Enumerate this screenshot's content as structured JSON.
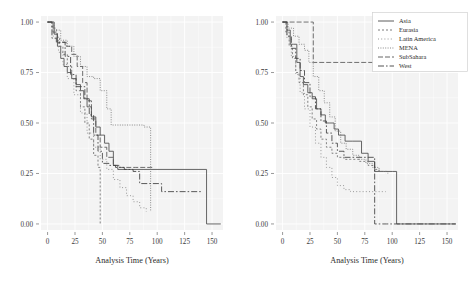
{
  "figure": {
    "panels": [
      {
        "id": "left",
        "xlabel": "Analysis Time (Years)",
        "ylabel": "",
        "xticks": [
          0,
          25,
          50,
          75,
          100,
          125,
          150
        ],
        "xticklabels": [
          "0",
          "25",
          "50",
          "75",
          "100",
          "125",
          "150"
        ],
        "yticks": [
          0.0,
          0.25,
          0.5,
          0.75,
          1.0
        ],
        "yticklabels": [
          "0.00",
          "0.25",
          "0.50",
          "0.75",
          "1.00"
        ],
        "xlim": [
          -6,
          160
        ],
        "ylim": [
          -0.03,
          1.03
        ]
      },
      {
        "id": "right",
        "xlabel": "Analysis Time (Years)",
        "ylabel": "",
        "xticks": [
          0,
          25,
          50,
          75,
          100,
          125,
          150
        ],
        "xticklabels": [
          "0",
          "25",
          "50",
          "75",
          "100",
          "125",
          "150"
        ],
        "yticks": [
          0.0,
          0.25,
          0.5,
          0.75,
          1.0
        ],
        "yticklabels": [
          "0.00",
          "0.25",
          "0.50",
          "0.75",
          "1.00"
        ],
        "xlim": [
          -6,
          160
        ],
        "ylim": [
          -0.03,
          1.03
        ]
      }
    ]
  },
  "legend": {
    "position": "top-right",
    "items": [
      {
        "label": "Asia",
        "dash": "none",
        "color": "#4a4a4a"
      },
      {
        "label": "Eurasia",
        "dash": "2,2",
        "color": "#6e6e6e"
      },
      {
        "label": "Latin America",
        "dash": "1,2.2",
        "color": "#8a8a8a"
      },
      {
        "label": "MENA",
        "dash": "1,1.4",
        "color": "#7a7a7a"
      },
      {
        "label": "SubSahara",
        "dash": "5,2",
        "color": "#555555"
      },
      {
        "label": "West",
        "dash": "6,2,1.6,2",
        "color": "#3f3f3f"
      }
    ]
  },
  "chart_data": {
    "type": "line",
    "title": "",
    "xlabel": "Analysis Time (Years)",
    "ylabel": "",
    "xlim": [
      -6,
      160
    ],
    "ylim": [
      -0.03,
      1.03
    ],
    "grid": true,
    "panels": [
      {
        "name": "left",
        "series": [
          {
            "name": "Asia",
            "style": "solid",
            "x": [
              0,
              3,
              6,
              9,
              12,
              15,
              18,
              22,
              26,
              30,
              33,
              36,
              40,
              44,
              48,
              52,
              56,
              60,
              64,
              145,
              145,
              158
            ],
            "y": [
              1.0,
              1.0,
              0.94,
              0.88,
              0.82,
              0.78,
              0.75,
              0.72,
              0.69,
              0.66,
              0.62,
              0.58,
              0.53,
              0.48,
              0.44,
              0.4,
              0.36,
              0.29,
              0.27,
              0.27,
              0.0,
              0.0
            ]
          },
          {
            "name": "Eurasia",
            "style": "dashed",
            "x": [
              0,
              4,
              8,
              11,
              14,
              18,
              22,
              26,
              30,
              34,
              38,
              42,
              46,
              48,
              48
            ],
            "y": [
              1.0,
              0.97,
              0.92,
              0.88,
              0.84,
              0.78,
              0.72,
              0.66,
              0.58,
              0.5,
              0.42,
              0.34,
              0.28,
              0.12,
              0.0
            ]
          },
          {
            "name": "Latin America",
            "style": "dotted",
            "x": [
              0,
              5,
              10,
              14,
              18,
              24,
              30,
              36,
              42,
              48,
              54,
              60,
              66,
              72,
              78,
              84,
              90
            ],
            "y": [
              1.0,
              0.93,
              0.85,
              0.79,
              0.72,
              0.64,
              0.55,
              0.45,
              0.38,
              0.32,
              0.27,
              0.22,
              0.18,
              0.14,
              0.11,
              0.08,
              0.06
            ]
          },
          {
            "name": "MENA",
            "style": "dotted-fine",
            "x": [
              0,
              6,
              12,
              18,
              24,
              30,
              36,
              42,
              48,
              54,
              58,
              62,
              68,
              80,
              88,
              94,
              94
            ],
            "y": [
              1.0,
              0.96,
              0.91,
              0.88,
              0.83,
              0.78,
              0.73,
              0.72,
              0.66,
              0.57,
              0.49,
              0.49,
              0.49,
              0.49,
              0.48,
              0.28,
              0.06
            ]
          },
          {
            "name": "SubSahara",
            "style": "longdash",
            "x": [
              0,
              5,
              9,
              13,
              17,
              22,
              27,
              32,
              36,
              40,
              44,
              48,
              54,
              60,
              66,
              72,
              80,
              88,
              94,
              96
            ],
            "y": [
              1.0,
              0.95,
              0.9,
              0.9,
              0.88,
              0.84,
              0.78,
              0.7,
              0.61,
              0.52,
              0.44,
              0.38,
              0.33,
              0.29,
              0.28,
              0.28,
              0.28,
              0.28,
              0.28,
              0.28
            ]
          },
          {
            "name": "West",
            "style": "dashdot",
            "x": [
              0,
              4,
              8,
              12,
              16,
              21,
              26,
              30,
              34,
              38,
              42,
              46,
              50,
              56,
              62,
              70,
              78,
              84,
              92,
              104,
              116,
              128,
              140
            ],
            "y": [
              1.0,
              0.92,
              0.9,
              0.9,
              0.83,
              0.74,
              0.68,
              0.68,
              0.62,
              0.54,
              0.44,
              0.36,
              0.3,
              0.29,
              0.28,
              0.27,
              0.26,
              0.2,
              0.2,
              0.16,
              0.16,
              0.16,
              0.16
            ]
          }
        ]
      },
      {
        "name": "right",
        "series": [
          {
            "name": "Asia",
            "style": "solid",
            "x": [
              0,
              4,
              7,
              10,
              13,
              16,
              19,
              23,
              27,
              31,
              35,
              39,
              43,
              47,
              51,
              57,
              64,
              72,
              78,
              84,
              92,
              100,
              104,
              104,
              158
            ],
            "y": [
              1.0,
              0.96,
              0.89,
              0.89,
              0.8,
              0.73,
              0.69,
              0.65,
              0.62,
              0.57,
              0.54,
              0.5,
              0.5,
              0.47,
              0.44,
              0.41,
              0.41,
              0.35,
              0.31,
              0.26,
              0.26,
              0.26,
              0.26,
              0.0,
              0.0
            ]
          },
          {
            "name": "Eurasia",
            "style": "dashed",
            "x": [
              0,
              3,
              6,
              9,
              12,
              15,
              19,
              23,
              27,
              31,
              35,
              40,
              45,
              50,
              56,
              62,
              70,
              78,
              84,
              88,
              96
            ],
            "y": [
              1.0,
              0.95,
              0.88,
              0.82,
              0.75,
              0.7,
              0.64,
              0.58,
              0.52,
              0.47,
              0.42,
              0.38,
              0.35,
              0.33,
              0.32,
              0.32,
              0.31,
              0.29,
              0.27,
              0.26,
              0.25
            ]
          },
          {
            "name": "Latin America",
            "style": "dotted",
            "x": [
              0,
              4,
              8,
              12,
              16,
              20,
              25,
              30,
              35,
              40,
              45,
              50,
              56,
              62,
              70,
              78,
              86,
              94
            ],
            "y": [
              1.0,
              0.92,
              0.83,
              0.74,
              0.65,
              0.57,
              0.48,
              0.4,
              0.33,
              0.28,
              0.23,
              0.19,
              0.17,
              0.16,
              0.16,
              0.16,
              0.16,
              0.16
            ]
          },
          {
            "name": "MENA",
            "style": "dotted-fine",
            "x": [
              0,
              5,
              10,
              15,
              20,
              24,
              24,
              28,
              33,
              38,
              43,
              48,
              53,
              58,
              64,
              70,
              76,
              82,
              88,
              94
            ],
            "y": [
              1.0,
              0.97,
              0.93,
              0.89,
              0.86,
              0.8,
              0.8,
              0.73,
              0.66,
              0.6,
              0.53,
              0.46,
              0.4,
              0.37,
              0.34,
              0.32,
              0.3,
              0.28,
              0.26,
              0.25
            ]
          },
          {
            "name": "SubSahara",
            "style": "longdash",
            "x": [
              0,
              6,
              12,
              18,
              24,
              28,
              28,
              44,
              60,
              76,
              92,
              100,
              112,
              124,
              140,
              155
            ],
            "y": [
              1.0,
              1.0,
              1.0,
              1.0,
              1.0,
              1.0,
              0.8,
              0.8,
              0.8,
              0.8,
              0.8,
              0.8,
              0.8,
              0.8,
              0.8,
              0.8
            ]
          },
          {
            "name": "West",
            "style": "dashdot",
            "x": [
              0,
              4,
              8,
              12,
              16,
              20,
              25,
              30,
              35,
              40,
              45,
              50,
              56,
              62,
              70,
              78,
              84,
              84,
              95,
              104,
              120,
              140,
              158
            ],
            "y": [
              1.0,
              0.93,
              0.87,
              0.82,
              0.76,
              0.7,
              0.63,
              0.57,
              0.51,
              0.45,
              0.4,
              0.36,
              0.33,
              0.33,
              0.33,
              0.33,
              0.33,
              0.0,
              0.0,
              0.0,
              0.0,
              0.0,
              0.0
            ]
          }
        ]
      }
    ]
  }
}
